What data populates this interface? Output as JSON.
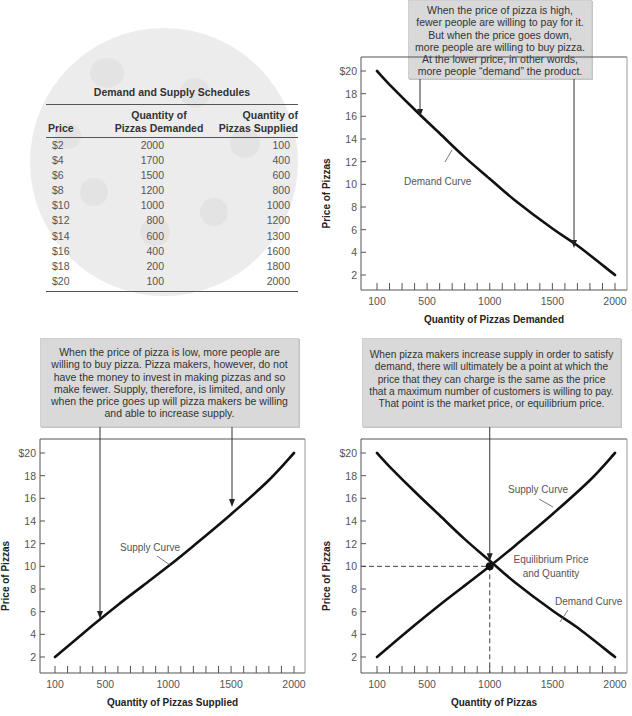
{
  "table": {
    "title": "Demand and Supply Schedules",
    "headers": [
      "Price",
      "Quantity of Pizzas Demanded",
      "Quantity of Pizzas Supplied"
    ],
    "header_lines": {
      "price": "Price",
      "demanded_1": "Quantity of",
      "demanded_2": "Pizzas Demanded",
      "supplied_1": "Quantity of",
      "supplied_2": "Pizzas Supplied"
    },
    "rows": [
      {
        "price": "$2",
        "demanded": "2000",
        "supplied": "100"
      },
      {
        "price": "$4",
        "demanded": "1700",
        "supplied": "400"
      },
      {
        "price": "$6",
        "demanded": "1500",
        "supplied": "600"
      },
      {
        "price": "$8",
        "demanded": "1200",
        "supplied": "800"
      },
      {
        "price": "$10",
        "demanded": "1000",
        "supplied": "1000"
      },
      {
        "price": "$12",
        "demanded": "800",
        "supplied": "1200"
      },
      {
        "price": "$14",
        "demanded": "600",
        "supplied": "1300"
      },
      {
        "price": "$16",
        "demanded": "400",
        "supplied": "1600"
      },
      {
        "price": "$18",
        "demanded": "200",
        "supplied": "1800"
      },
      {
        "price": "$20",
        "demanded": "100",
        "supplied": "2000"
      }
    ]
  },
  "callouts": {
    "demand": "When the price of pizza is high, fewer people are willing to pay for it. But when the price goes down, more people are willing to buy pizza. At the lower price, in other words, more people “demand” the product.",
    "supply": "When the price of pizza is low, more people are willing to buy pizza. Pizza makers, however, do not have the money to invest in making pizzas and so make fewer. Supply, therefore, is limited, and only when the price goes up will pizza makers be willing and able to increase supply.",
    "equilibrium": "When pizza makers increase supply in order to satisfy demand, there will ultimately be a point at which the price that they can charge is the same as the price that a maximum number of customers is willing to pay. That point is the market price, or equilibrium price."
  },
  "colors": {
    "curve": "#111111",
    "axis": "#555555",
    "callout_bg": "#d9d9d9",
    "pizza_bg": "#ececec"
  },
  "chart_data": [
    {
      "type": "line",
      "title": "Demand Curve",
      "xlabel": "Quantity of Pizzas Demanded",
      "ylabel": "Price of Pizzas",
      "x_ticks": [
        "100",
        "500",
        "1000",
        "1500",
        "2000"
      ],
      "y_ticks": [
        "2",
        "4",
        "6",
        "8",
        "10",
        "12",
        "14",
        "16",
        "18",
        "$20"
      ],
      "xlim": [
        100,
        2000
      ],
      "ylim": [
        2,
        20
      ],
      "series": [
        {
          "name": "Demand Curve",
          "x": [
            100,
            200,
            400,
            600,
            800,
            1000,
            1200,
            1500,
            1700,
            2000
          ],
          "y": [
            20,
            18.8,
            16.6,
            14.5,
            12.4,
            10.5,
            8.6,
            6.1,
            4.6,
            2
          ]
        }
      ],
      "annotations": [
        "Demand Curve"
      ],
      "grid": false
    },
    {
      "type": "line",
      "title": "Supply Curve",
      "xlabel": "Quantity of Pizzas Supplied",
      "ylabel": "Price of Pizzas",
      "x_ticks": [
        "100",
        "500",
        "1000",
        "1500",
        "2000"
      ],
      "y_ticks": [
        "2",
        "4",
        "6",
        "8",
        "10",
        "12",
        "14",
        "16",
        "18",
        "$20"
      ],
      "xlim": [
        100,
        2000
      ],
      "ylim": [
        2,
        20
      ],
      "series": [
        {
          "name": "Supply Curve",
          "x": [
            100,
            400,
            600,
            800,
            1000,
            1200,
            1500,
            1800,
            2000
          ],
          "y": [
            2,
            4.8,
            6.6,
            8.3,
            10,
            11.8,
            14.6,
            17.6,
            20
          ]
        }
      ],
      "annotations": [
        "Supply Curve"
      ],
      "grid": false
    },
    {
      "type": "line",
      "title": "Equilibrium",
      "xlabel": "Quantity of Pizzas",
      "ylabel": "Price of Pizzas",
      "x_ticks": [
        "100",
        "500",
        "1000",
        "1500",
        "2000"
      ],
      "y_ticks": [
        "2",
        "4",
        "6",
        "8",
        "10",
        "12",
        "14",
        "16",
        "18",
        "$20"
      ],
      "xlim": [
        100,
        2000
      ],
      "ylim": [
        2,
        20
      ],
      "series": [
        {
          "name": "Supply Curve",
          "x": [
            100,
            400,
            600,
            800,
            1000,
            1200,
            1500,
            1800,
            2000
          ],
          "y": [
            2,
            4.8,
            6.6,
            8.3,
            10,
            11.8,
            14.6,
            17.6,
            20
          ]
        },
        {
          "name": "Demand Curve",
          "x": [
            100,
            200,
            400,
            600,
            800,
            1000,
            1200,
            1500,
            1700,
            2000
          ],
          "y": [
            20,
            18.8,
            16.6,
            14.5,
            12.4,
            10.5,
            8.6,
            6.1,
            4.6,
            2
          ]
        }
      ],
      "equilibrium": {
        "x": 1000,
        "y": 10,
        "label": "Equilibrium Price and Quantity"
      },
      "annotations": [
        "Supply Curve",
        "Demand Curve",
        "Equilibrium Price and Quantity"
      ],
      "grid": false
    }
  ],
  "labels": {
    "demand_curve": "Demand Curve",
    "supply_curve": "Supply Curve",
    "eq_line1": "Equilibrium Price",
    "eq_line2": "and Quantity",
    "ylabel": "Price of Pizzas",
    "xlabel_demand": "Quantity of Pizzas Demanded",
    "xlabel_supply": "Quantity of Pizzas Supplied",
    "xlabel_both": "Quantity of Pizzas"
  }
}
